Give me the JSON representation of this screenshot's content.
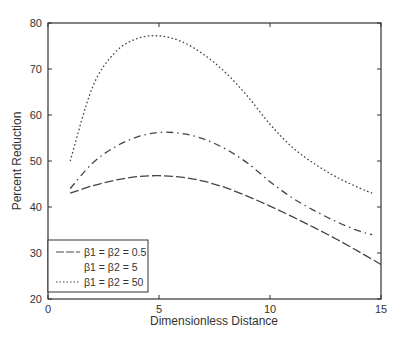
{
  "chart_data": {
    "type": "line",
    "title": "",
    "xlabel": "Dimensionless Distance",
    "ylabel": "Percent Reduction",
    "xlim": [
      0,
      15
    ],
    "ylim": [
      20,
      80
    ],
    "xticks": [
      0,
      5,
      10,
      15
    ],
    "yticks": [
      20,
      30,
      40,
      50,
      60,
      70,
      80
    ],
    "grid": false,
    "legend_position": "lower left",
    "series": [
      {
        "name": "β1 = β2 = 0.5",
        "style": "dashed",
        "x": [
          1,
          2,
          3,
          4,
          5,
          6,
          7,
          8,
          9,
          10,
          11,
          12,
          13,
          14,
          15
        ],
        "y": [
          43,
          44.6,
          45.8,
          46.6,
          46.8,
          46.5,
          45.6,
          44.2,
          42.3,
          40.2,
          37.9,
          35.5,
          33,
          30.3,
          27.5
        ]
      },
      {
        "name": "β1 = β2 = 5",
        "style": "dash-dot",
        "x": [
          1,
          2,
          3,
          4,
          5,
          6,
          7,
          8,
          9,
          10,
          11,
          12,
          13,
          14,
          14.6
        ],
        "y": [
          44,
          49.5,
          53,
          55.2,
          56.2,
          56,
          54.8,
          52.6,
          49.5,
          45.5,
          42,
          39.2,
          36.8,
          34.8,
          34
        ]
      },
      {
        "name": "β1 = β2 = 50",
        "style": "dotted",
        "x": [
          1,
          2,
          3,
          4,
          5,
          6,
          7,
          8,
          9,
          10,
          11,
          12,
          13,
          14,
          14.6
        ],
        "y": [
          50,
          66,
          73.5,
          76.6,
          77.2,
          76,
          73.2,
          69.2,
          64,
          58,
          53,
          49.4,
          46.5,
          44.2,
          43
        ]
      }
    ]
  },
  "axes": {
    "xlabel": "Dimensionless Distance",
    "ylabel": "Percent Reduction",
    "xtick_labels": [
      "0",
      "5",
      "10",
      "15"
    ],
    "ytick_labels": [
      "20",
      "30",
      "40",
      "50",
      "60",
      "70",
      "80"
    ]
  },
  "legend": {
    "items": [
      {
        "label": "β1 = β2 = 0.5",
        "style": "dashed"
      },
      {
        "label": "β1 = β2 = 5",
        "style": "dash-dot"
      },
      {
        "label": "β1 = β2 = 50",
        "style": "dotted"
      }
    ]
  },
  "colors": {
    "line": "#444444",
    "axis": "#333333",
    "background": "#ffffff"
  }
}
